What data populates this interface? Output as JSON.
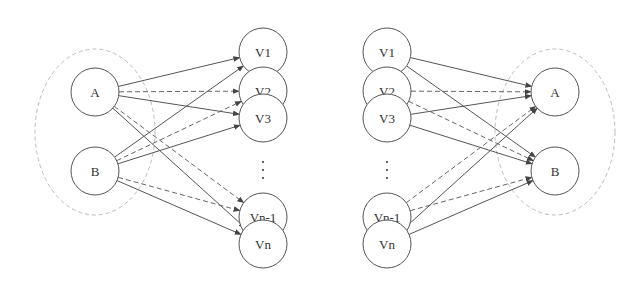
{
  "diagram": {
    "left": {
      "sources": [
        {
          "id": "A",
          "label": "A",
          "x": 95,
          "y": 92
        },
        {
          "id": "B",
          "label": "B",
          "x": 95,
          "y": 171
        }
      ],
      "targets": [
        {
          "id": "V1",
          "label": "V1",
          "x": 263,
          "y": 52
        },
        {
          "id": "V2",
          "label": "V2",
          "x": 263,
          "y": 91
        },
        {
          "id": "V3",
          "label": "V3",
          "x": 263,
          "y": 118
        },
        {
          "id": "Vn-1",
          "label": "Vn-1",
          "x": 263,
          "y": 217
        },
        {
          "id": "Vn",
          "label": "Vn",
          "x": 263,
          "y": 244
        }
      ],
      "group_ellipse": {
        "cx": 95,
        "cy": 132,
        "rx": 60,
        "ry": 83
      },
      "ellipsis_dots": {
        "x": 263,
        "y": [
          162,
          170,
          178
        ]
      },
      "edges": [
        {
          "from": "A",
          "to": "V1",
          "style": "solid"
        },
        {
          "from": "A",
          "to": "V2",
          "style": "dashed"
        },
        {
          "from": "A",
          "to": "V3",
          "style": "solid"
        },
        {
          "from": "A",
          "to": "Vn-1",
          "style": "dashed"
        },
        {
          "from": "A",
          "to": "Vn",
          "style": "solid"
        },
        {
          "from": "B",
          "to": "V1",
          "style": "solid"
        },
        {
          "from": "B",
          "to": "V2",
          "style": "dashed"
        },
        {
          "from": "B",
          "to": "V3",
          "style": "solid"
        },
        {
          "from": "B",
          "to": "Vn-1",
          "style": "dashed"
        },
        {
          "from": "B",
          "to": "Vn",
          "style": "solid"
        }
      ]
    },
    "right": {
      "sources": [
        {
          "id": "V1",
          "label": "V1",
          "x": 387,
          "y": 52
        },
        {
          "id": "V2",
          "label": "V2",
          "x": 387,
          "y": 91
        },
        {
          "id": "V3",
          "label": "V3",
          "x": 387,
          "y": 118
        },
        {
          "id": "Vn-1",
          "label": "Vn-1",
          "x": 387,
          "y": 217
        },
        {
          "id": "Vn",
          "label": "Vn",
          "x": 387,
          "y": 244
        }
      ],
      "targets": [
        {
          "id": "A",
          "label": "A",
          "x": 555,
          "y": 92
        },
        {
          "id": "B",
          "label": "B",
          "x": 555,
          "y": 171
        }
      ],
      "group_ellipse": {
        "cx": 555,
        "cy": 132,
        "rx": 60,
        "ry": 83
      },
      "ellipsis_dots": {
        "x": 387,
        "y": [
          162,
          170,
          178
        ]
      },
      "edges": [
        {
          "from": "V1",
          "to": "A",
          "style": "solid"
        },
        {
          "from": "V1",
          "to": "B",
          "style": "solid"
        },
        {
          "from": "V2",
          "to": "A",
          "style": "dashed"
        },
        {
          "from": "V2",
          "to": "B",
          "style": "dashed"
        },
        {
          "from": "V3",
          "to": "A",
          "style": "solid"
        },
        {
          "from": "V3",
          "to": "B",
          "style": "solid"
        },
        {
          "from": "Vn-1",
          "to": "A",
          "style": "dashed"
        },
        {
          "from": "Vn-1",
          "to": "B",
          "style": "dashed"
        },
        {
          "from": "Vn",
          "to": "A",
          "style": "solid"
        },
        {
          "from": "Vn",
          "to": "B",
          "style": "solid"
        }
      ]
    },
    "node_radius": 24,
    "colors": {
      "edge": "#555555",
      "node_stroke": "#555555",
      "ellipse": "#bbbbbb"
    }
  }
}
